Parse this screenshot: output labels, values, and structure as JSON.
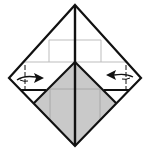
{
  "diagram": {
    "type": "origami-fold-step",
    "colors": {
      "background": "#ffffff",
      "outline": "#111111",
      "grid": "#bdbdbd",
      "shaded": "#c9c9c9"
    },
    "vertices": {
      "top": [
        75,
        5
      ],
      "left": [
        9,
        78
      ],
      "right": [
        141,
        78
      ],
      "bottom": [
        75,
        146
      ],
      "shaded_apex": [
        75,
        62
      ]
    },
    "arrows": [
      {
        "name": "fold-left-flap-arrow",
        "direction": "right"
      },
      {
        "name": "fold-right-flap-arrow",
        "direction": "left"
      }
    ]
  }
}
